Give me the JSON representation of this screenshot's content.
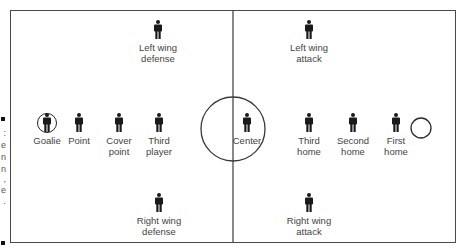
{
  "diagram": {
    "type": "ice hockey / lacrosse field positions",
    "colors": {
      "line": "#4a4a4a",
      "figure": "#1a1a1a",
      "label": "#444444",
      "background": "#ffffff"
    },
    "field": {
      "left": 10,
      "top": 10,
      "right": 456,
      "bottom": 243
    },
    "center_line_x": 233,
    "center_circle": {
      "cx": 233,
      "cy": 129,
      "r": 32
    },
    "goal_circle": {
      "cx": 421,
      "cy": 128,
      "r": 10
    },
    "players": [
      {
        "id": "left-wing-defense",
        "label": "Left wing\ndefense",
        "x": 158,
        "y": 20
      },
      {
        "id": "left-wing-attack",
        "label": "Left wing\nattack",
        "x": 309,
        "y": 20
      },
      {
        "id": "goalie",
        "label": "Goalie",
        "x": 47,
        "y": 113
      },
      {
        "id": "point",
        "label": "Point",
        "x": 79,
        "y": 113
      },
      {
        "id": "cover-point",
        "label": "Cover\npoint",
        "x": 119,
        "y": 113
      },
      {
        "id": "third-player",
        "label": "Third\nplayer",
        "x": 159,
        "y": 113
      },
      {
        "id": "center",
        "label": "Center",
        "x": 247,
        "y": 113
      },
      {
        "id": "third-home",
        "label": "Third\nhome",
        "x": 309,
        "y": 113
      },
      {
        "id": "second-home",
        "label": "Second\nhome",
        "x": 353,
        "y": 113
      },
      {
        "id": "first-home",
        "label": "First\nhome",
        "x": 396,
        "y": 113
      },
      {
        "id": "right-wing-defense",
        "label": "Right wing\ndefense",
        "x": 159,
        "y": 193
      },
      {
        "id": "right-wing-attack",
        "label": "Right wing\nattack",
        "x": 309,
        "y": 193
      }
    ],
    "edge_fragments": [
      ":",
      "e",
      "n",
      "n",
      ",",
      "e",
      ".",
      ""
    ]
  }
}
